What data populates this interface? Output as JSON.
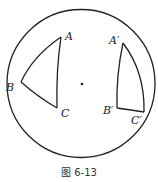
{
  "figure": {
    "caption": "图 6-13",
    "circle": {
      "cx": 81,
      "cy": 83.5,
      "r": 74
    },
    "center_point": {
      "x": 82,
      "y": 84
    },
    "triangle_left": {
      "vertices": {
        "A": [
          61,
          37
        ],
        "B": [
          21,
          82
        ],
        "C": [
          57,
          108
        ]
      },
      "labels": {
        "A": "A",
        "B": "B",
        "C": "C"
      }
    },
    "triangle_right": {
      "vertices": {
        "A'": [
          123,
          43
        ],
        "B'": [
          117,
          108
        ],
        "C'": [
          144,
          112
        ]
      },
      "labels": {
        "A'": "A′",
        "B'": "B′",
        "C'": "C′"
      }
    }
  }
}
